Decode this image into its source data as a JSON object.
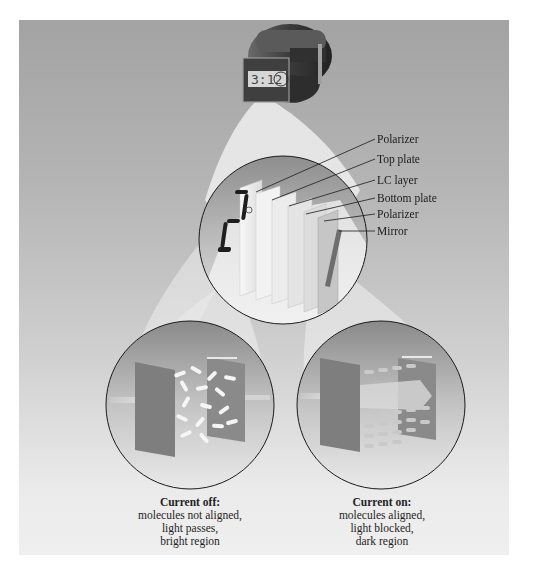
{
  "figure": {
    "components": {
      "watch": {
        "icon": "digital-watch-icon",
        "display_text": "3:12"
      },
      "layer_labels": [
        {
          "text": "Polarizer"
        },
        {
          "text": "Top plate"
        },
        {
          "text": "LC layer"
        },
        {
          "text": "Bottom plate"
        },
        {
          "text": "Polarizer"
        },
        {
          "text": "Mirror"
        }
      ],
      "segment_digit": "2"
    },
    "panels": [
      {
        "id": "current-off",
        "heading": "Current off:",
        "lines": [
          "molecules not aligned,",
          "light passes,",
          "bright region"
        ]
      },
      {
        "id": "current-on",
        "heading": "Current on:",
        "lines": [
          "molecules aligned,",
          "light blocked,",
          "dark region"
        ]
      }
    ]
  },
  "colors": {
    "panel_top": "#a3a3a3",
    "panel_bottom": "#efefef",
    "circle_outline": "#1a1a1a",
    "light_cone": "#f2f2f2",
    "plate": "#7e7e7e",
    "segment": "#1e1e1e"
  }
}
